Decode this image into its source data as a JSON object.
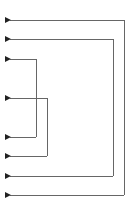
{
  "diagram": {
    "title": "",
    "line_color": "#555555",
    "arrow_color": "#222222",
    "connectors": [
      {
        "id": "outer",
        "x": 124,
        "y_top": 20,
        "y_bottom": 195
      },
      {
        "id": "second",
        "x": 113,
        "y_top": 39,
        "y_bottom": 176
      },
      {
        "id": "inner-left",
        "x": 36,
        "y_top": 59,
        "y_bottom": 137
      },
      {
        "id": "inner-right",
        "x": 47,
        "y_top": 98,
        "y_bottom": 156
      }
    ],
    "arrow_tip_x": 9
  }
}
